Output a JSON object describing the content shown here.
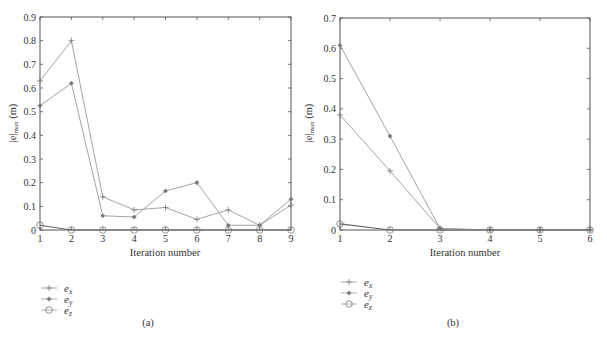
{
  "chart_data": [
    {
      "type": "line",
      "panel": "(a)",
      "title": "",
      "xlabel": "Iteration number",
      "ylabel": "|e|max (m)",
      "x": [
        1,
        2,
        3,
        4,
        5,
        6,
        7,
        8,
        9
      ],
      "xlim": [
        1,
        9
      ],
      "ylim": [
        0,
        0.9
      ],
      "yticks": [
        "0",
        "0.1",
        "0.2",
        "0.3",
        "0.4",
        "0.5",
        "0.6",
        "0.7",
        "0.8",
        "0.9"
      ],
      "xticks": [
        "1",
        "2",
        "3",
        "4",
        "5",
        "6",
        "7",
        "8",
        "9"
      ],
      "grid": false,
      "legend_position": "below-left",
      "series": [
        {
          "name": "e_x",
          "marker": "plus",
          "values": [
            0.63,
            0.8,
            0.14,
            0.085,
            0.095,
            0.045,
            0.085,
            0.02,
            0.105
          ]
        },
        {
          "name": "e_y",
          "marker": "star",
          "values": [
            0.525,
            0.62,
            0.06,
            0.055,
            0.165,
            0.2,
            0.02,
            0.02,
            0.13
          ]
        },
        {
          "name": "e_z",
          "marker": "circle",
          "values": [
            0.02,
            0.0,
            0.0,
            0.0,
            0.0,
            0.0,
            0.0,
            0.0,
            0.0
          ]
        }
      ],
      "caption": "(a)"
    },
    {
      "type": "line",
      "panel": "(b)",
      "title": "",
      "xlabel": "Iteration number",
      "ylabel": "|e|max (m)",
      "x": [
        1,
        2,
        3,
        4,
        5,
        6
      ],
      "xlim": [
        1,
        6
      ],
      "ylim": [
        0,
        0.7
      ],
      "yticks": [
        "0",
        "0.1",
        "0.2",
        "0.3",
        "0.4",
        "0.5",
        "0.6",
        "0.7"
      ],
      "xticks": [
        "1",
        "2",
        "3",
        "4",
        "5",
        "6"
      ],
      "grid": false,
      "legend_position": "below-left",
      "series": [
        {
          "name": "e_x",
          "marker": "plus",
          "values": [
            0.38,
            0.195,
            0.005,
            0.0,
            0.0,
            0.0
          ]
        },
        {
          "name": "e_y",
          "marker": "star",
          "values": [
            0.61,
            0.31,
            0.005,
            0.0,
            0.0,
            0.0
          ]
        },
        {
          "name": "e_z",
          "marker": "circle",
          "values": [
            0.02,
            0.0,
            0.0,
            0.0,
            0.0,
            0.0
          ]
        }
      ],
      "caption": "(b)"
    }
  ],
  "labels": {
    "xlabel": "Iteration number",
    "ylabel_main": "|e|",
    "ylabel_sub": "max",
    "ylabel_unit": " (m)",
    "legend": [
      {
        "base": "e",
        "sub": "x"
      },
      {
        "base": "e",
        "sub": "y"
      },
      {
        "base": "e",
        "sub": "z"
      }
    ],
    "caption_a": "(a)",
    "caption_b": "(b)"
  },
  "colors": {
    "axis": "#555555",
    "line": "#9a9a9a",
    "marker": "#777777"
  }
}
